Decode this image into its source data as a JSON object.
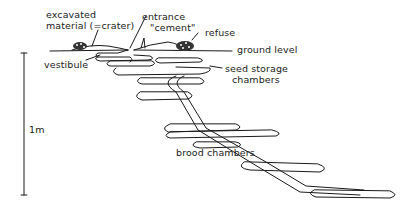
{
  "figure": {
    "labels": {
      "excavated_line1": "excavated",
      "excavated_line2": "material (=crater)",
      "entrance": "entrance",
      "cement": "\"cement\"",
      "refuse": "refuse",
      "ground_level": "ground level",
      "vestibule": "vestibule",
      "seed_storage_line1": "seed storage",
      "seed_storage_line2": "chambers",
      "brood_chambers": "brood chambers",
      "scale": "1m"
    },
    "colors": {
      "line": "#1a1a1a",
      "background": "#ffffff"
    }
  }
}
